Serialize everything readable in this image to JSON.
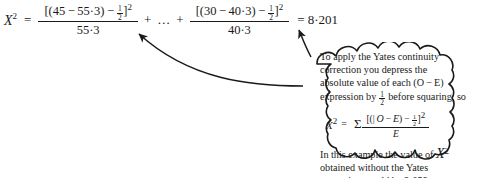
{
  "document": {
    "kind": "statistics-textbook-figure",
    "topic": "Yates continuity correction"
  },
  "main_equation": {
    "lhs_var": "X",
    "lhs_exponent": "2",
    "equals": "=",
    "term1": {
      "numerator_open": "[(",
      "numerator_observed": "45",
      "numerator_minus": "−",
      "numerator_expected": "55·3",
      "numerator_close": ")",
      "correction_minus": "−",
      "correction_num": "1",
      "correction_den": "2",
      "numerator_bracket_close": "]",
      "numerator_exponent": "2",
      "denominator": "55·3"
    },
    "ellipsis_operator_left": "+",
    "ellipsis": "…",
    "ellipsis_operator_right": "+",
    "term2": {
      "numerator_open": "[(",
      "numerator_observed": "30",
      "numerator_minus": "−",
      "numerator_expected": "40·3",
      "numerator_close": ")",
      "correction_minus": "−",
      "correction_num": "1",
      "correction_den": "2",
      "numerator_bracket_close": "]",
      "numerator_exponent": "2",
      "denominator": "40·3"
    },
    "result_equals": "=",
    "result_value": "8·201"
  },
  "bubble": {
    "paragraph1_line1": "To apply the Yates continuity",
    "paragraph1_line2": "correction you depress the",
    "paragraph1_line3": "absolute value of each (O − E)",
    "paragraph1_line4_pre": "expression by ",
    "paragraph1_line4_frac_num": "1",
    "paragraph1_line4_frac_den": "2",
    "paragraph1_line4_post": " before squaring, so",
    "formula": {
      "lhs_var": "X",
      "lhs_exponent": "2",
      "equals": "=",
      "sigma": "Σ",
      "numerator_open": "[(|",
      "numerator_observed": "O",
      "numerator_minus": "−",
      "numerator_expected": "E",
      "numerator_close": ")",
      "correction_minus": "−",
      "correction_num": "1",
      "correction_den": "2",
      "numerator_bracket_close": "]",
      "numerator_exponent": "2",
      "denominator": "E"
    },
    "paragraph2_line1_pre": "In this example the value of ",
    "paragraph2_line1_var": "X",
    "paragraph2_line1_exponent": "2",
    "paragraph2_line2": "obtained without the Yates",
    "paragraph2_line3": "correction would be 9·059."
  },
  "colors": {
    "ink": "#1a1a1a",
    "background": "#ffffff"
  },
  "annotations": {
    "arrow1_name": "arrow-to-first-correction-term",
    "arrow2_name": "arrow-to-second-correction-term"
  }
}
